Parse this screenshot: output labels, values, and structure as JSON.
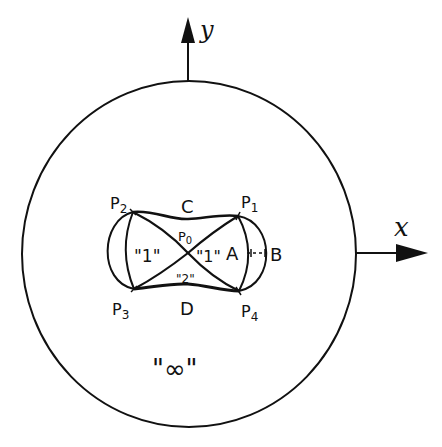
{
  "diagram": {
    "type": "topological sketch",
    "colors": {
      "ink": "#111111",
      "background": "#ffffff"
    },
    "axes": {
      "x": {
        "label": "x"
      },
      "y": {
        "label": "y"
      }
    },
    "outer_region": {
      "shape": "circle",
      "label": "\"∞\""
    },
    "points": {
      "p0": {
        "label": "P",
        "sub": "0"
      },
      "p1": {
        "label": "P",
        "sub": "1"
      },
      "p2": {
        "label": "P",
        "sub": "2"
      },
      "p3": {
        "label": "P",
        "sub": "3"
      },
      "p4": {
        "label": "P",
        "sub": "4"
      }
    },
    "curve_labels": {
      "a": "A",
      "b": "B",
      "c": "C",
      "d": "D"
    },
    "region_labels": {
      "left_lobe": "\"1\"",
      "right_lobe": "\"1\"",
      "bottom_center": "\"2\""
    }
  }
}
